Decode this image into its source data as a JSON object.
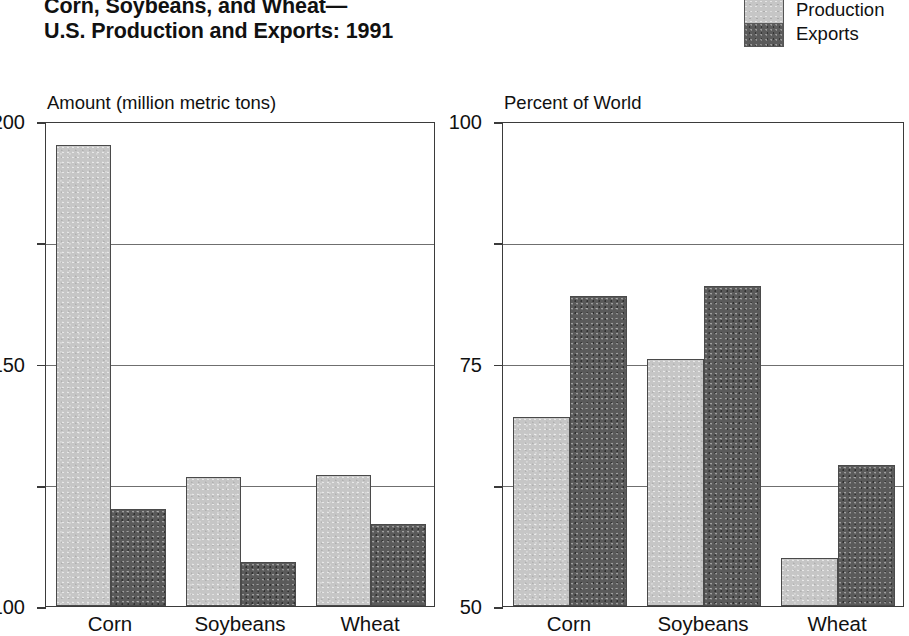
{
  "title": {
    "line1": "Corn, Soybeans, and Wheat—",
    "line2": "U.S. Production and Exports:  1991"
  },
  "legend": {
    "position": "top-right",
    "items": [
      {
        "label": "Production",
        "color": "#c6c6c6",
        "icon": "legend-swatch-light"
      },
      {
        "label": "Exports",
        "color": "#5a5a5a",
        "icon": "legend-swatch-dark"
      }
    ]
  },
  "chart_data": [
    {
      "type": "bar",
      "panel": "left",
      "title": "Amount (million metric tons)",
      "xlabel": "",
      "ylabel": "Amount (million metric tons)",
      "ylim": [
        0,
        200
      ],
      "yticks": [
        0,
        50,
        100,
        150,
        200
      ],
      "ytick_labels": [
        "0",
        "50",
        "100",
        "150",
        "200"
      ],
      "grid": true,
      "categories": [
        "Corn",
        "Soybeans",
        "Wheat"
      ],
      "series": [
        {
          "name": "Production",
          "color": "#c6c6c6",
          "values": [
            190,
            53,
            54
          ]
        },
        {
          "name": "Exports",
          "color": "#5a5a5a",
          "values": [
            40,
            18,
            34
          ]
        }
      ]
    },
    {
      "type": "bar",
      "panel": "right",
      "title": "Percent of World",
      "xlabel": "",
      "ylabel": "Percent of World",
      "ylim": [
        0,
        100
      ],
      "yticks": [
        0,
        25,
        50,
        75,
        100
      ],
      "ytick_labels": [
        "0",
        "25",
        "50",
        "75",
        "100"
      ],
      "grid": true,
      "categories": [
        "Corn",
        "Soybeans",
        "Wheat"
      ],
      "series": [
        {
          "name": "Production",
          "color": "#c6c6c6",
          "values": [
            39,
            51,
            10
          ]
        },
        {
          "name": "Exports",
          "color": "#5a5a5a",
          "values": [
            64,
            66,
            29
          ]
        }
      ]
    }
  ]
}
